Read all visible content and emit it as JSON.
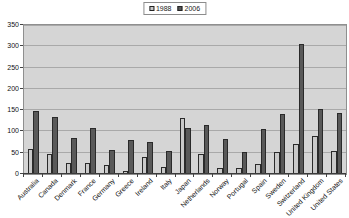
{
  "chart_data": {
    "type": "bar",
    "title": "",
    "xlabel": "",
    "ylabel": "",
    "categories": [
      "Australia",
      "Canada",
      "Denmark",
      "France",
      "Germany",
      "Greece",
      "Ireland",
      "Italy",
      "Japan",
      "Netherlands",
      "Norway",
      "Portugal",
      "Spain",
      "Sweden",
      "Switzerland",
      "United Kingdom",
      "United States"
    ],
    "series": [
      {
        "name": "1988",
        "color": "#c9c9c9",
        "values": [
          58,
          48,
          27,
          25,
          20,
          7,
          39,
          17,
          132,
          47,
          14,
          13,
          24,
          51,
          70,
          89,
          55
        ]
      },
      {
        "name": "2006",
        "color": "#595959",
        "values": [
          147,
          134,
          85,
          107,
          56,
          79,
          74,
          55,
          107,
          114,
          82,
          51,
          105,
          141,
          305,
          153,
          144
        ]
      }
    ],
    "ylim": [
      0,
      350
    ],
    "yticks": [
      0,
      50,
      100,
      150,
      200,
      250,
      300,
      350
    ],
    "grid": true,
    "legend_position": "top-center",
    "plot_background": "#d5d5d5",
    "gridline_color": "#a9a9a9",
    "bar_border_color": "#2a2a2a"
  }
}
